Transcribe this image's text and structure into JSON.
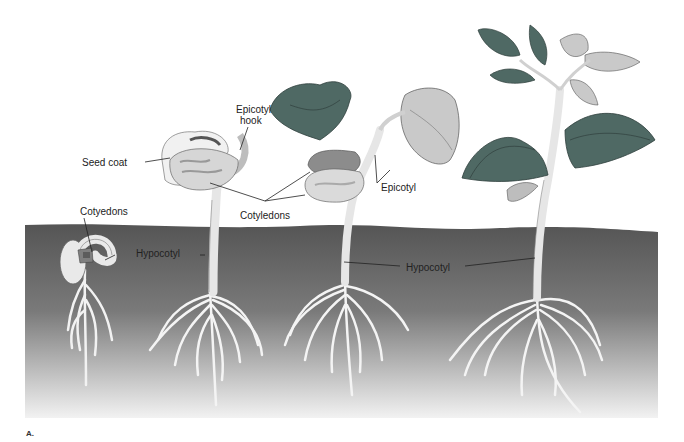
{
  "figure": {
    "figure_letter": "A.",
    "colors": {
      "soil_top": "#5a5a5a",
      "soil_bottom": "#efefef",
      "leaf_dark": "#4f6964",
      "leaf_light": "#c9c9c9",
      "stem": "#e6e6e6",
      "cotyledon": "#d8d8d8",
      "root": "#f5f5f5"
    },
    "labels": {
      "seed_coat": "Seed coat",
      "epicotyl_hook_line1": "Epicotyl",
      "epicotyl_hook_line2": "hook",
      "cotyedons_stage1": "Cotyedons",
      "hypocotyl_stage1": "Hypocotyl",
      "cotyledons": "Cotyledons",
      "epicotyl": "Epicotyl",
      "hypocotyl_shared": "Hypocotyl"
    },
    "stages": [
      {
        "index": 1,
        "description": "Germinating seed with hooked hypocotyl below soil"
      },
      {
        "index": 2,
        "description": "Seedling with seed coat and epicotyl hook emerging"
      },
      {
        "index": 3,
        "description": "Seedling with cotyledons and first leaves"
      },
      {
        "index": 4,
        "description": "Young bean plant with trifoliate leaves"
      }
    ]
  }
}
